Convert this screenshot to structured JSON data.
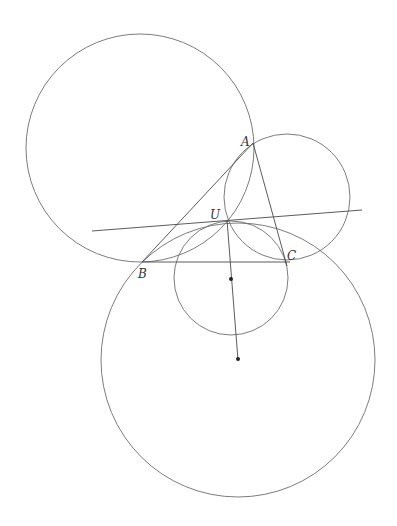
{
  "diagram": {
    "points": {
      "A": {
        "label": "A",
        "x": 253,
        "y": 143
      },
      "B": {
        "label": "B",
        "x": 142,
        "y": 262
      },
      "C": {
        "label": "C",
        "x": 285,
        "y": 262
      },
      "U": {
        "label": "U",
        "x": 227,
        "y": 220
      }
    },
    "labels": [
      {
        "id": "A",
        "text": "A",
        "x": 241,
        "y": 136
      },
      {
        "id": "U",
        "text": "U",
        "x": 210,
        "y": 209
      },
      {
        "id": "B",
        "text": "B",
        "x": 138,
        "y": 268
      },
      {
        "id": "C",
        "text": "C",
        "x": 287,
        "y": 250
      }
    ],
    "circles": [
      {
        "name": "circle-through-A-B-U",
        "cx": 140,
        "cy": 148,
        "r": 114
      },
      {
        "name": "circle-through-A-U-C",
        "cx": 287,
        "cy": 197,
        "r": 63
      },
      {
        "name": "small-circle-at-U",
        "cx": 231,
        "cy": 278,
        "r": 57
      },
      {
        "name": "large-circle-through-B-U",
        "cx": 238,
        "cy": 360,
        "r": 137
      }
    ],
    "segments": [
      {
        "name": "segment-AB",
        "x1": 253,
        "y1": 143,
        "x2": 142,
        "y2": 262
      },
      {
        "name": "segment-AC",
        "x1": 253,
        "y1": 143,
        "x2": 287,
        "y2": 266
      },
      {
        "name": "segment-BC",
        "x1": 142,
        "y1": 262,
        "x2": 290,
        "y2": 262
      },
      {
        "name": "tangent-line-through-U",
        "x1": 92,
        "y1": 231,
        "x2": 362,
        "y2": 210
      },
      {
        "name": "segment-U-to-centers",
        "x1": 227,
        "y1": 220,
        "x2": 238,
        "y2": 360
      }
    ],
    "centers": [
      {
        "name": "small-circle-center",
        "cx": 231,
        "cy": 279
      },
      {
        "name": "large-circle-center",
        "cx": 238,
        "cy": 359
      }
    ],
    "colors": {
      "stroke": "#6e6e6e",
      "point": "#222222",
      "background": "#ffffff"
    }
  }
}
